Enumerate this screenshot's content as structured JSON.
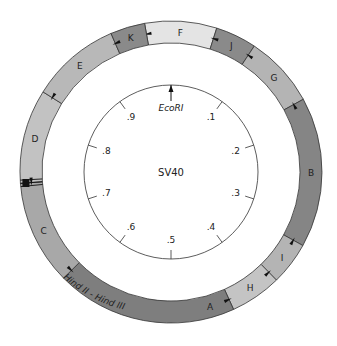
{
  "diagram": {
    "title": "SV40",
    "origin_site": {
      "label": "EcoRI",
      "position": 0.0
    },
    "map_ticks": [
      {
        "label": ".1",
        "position": 0.1
      },
      {
        "label": ".2",
        "position": 0.2
      },
      {
        "label": ".3",
        "position": 0.3
      },
      {
        "label": ".4",
        "position": 0.4
      },
      {
        "label": ".5",
        "position": 0.5
      },
      {
        "label": ".6",
        "position": 0.6
      },
      {
        "label": ".7",
        "position": 0.7
      },
      {
        "label": ".8",
        "position": 0.8
      },
      {
        "label": ".9",
        "position": 0.9
      }
    ],
    "ring_caption": "Hind II - Hind III",
    "fragments": [
      {
        "label": "F",
        "start": 0.972,
        "end": 0.049,
        "color": "#e4e4e4"
      },
      {
        "label": "J",
        "start": 0.049,
        "end": 0.093,
        "color": "#8a8a8a"
      },
      {
        "label": "G",
        "start": 0.093,
        "end": 0.17,
        "color": "#b4b4b4"
      },
      {
        "label": "B",
        "start": 0.17,
        "end": 0.331,
        "color": "#858585"
      },
      {
        "label": "I",
        "start": 0.331,
        "end": 0.377,
        "color": "#b4b4b4"
      },
      {
        "label": "H",
        "start": 0.377,
        "end": 0.432,
        "color": "#c4c4c4"
      },
      {
        "label": "A",
        "start": 0.432,
        "end": 0.626,
        "color": "#7e7e7e"
      },
      {
        "label": "C",
        "start": 0.626,
        "end": 0.738,
        "color": "#a8a8a8"
      },
      {
        "label": "D",
        "start": 0.738,
        "end": 0.839,
        "color": "#c2c2c2"
      },
      {
        "label": "E",
        "start": 0.839,
        "end": 0.935,
        "color": "#b8b8b8"
      },
      {
        "label": "K",
        "start": 0.935,
        "end": 0.972,
        "color": "#8a8a8a"
      }
    ],
    "origin_marker_position": 0.738,
    "colors": {
      "outline": "#333333",
      "text": "#222222",
      "marker": "#111111"
    }
  }
}
